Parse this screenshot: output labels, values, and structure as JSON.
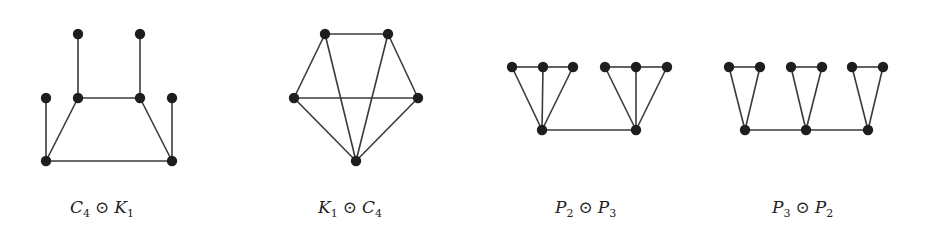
{
  "figure": {
    "graphs": [
      {
        "id": "c4-corona-k1",
        "label": {
          "left": "C",
          "left_sub": "4",
          "op": "⊙",
          "right": "K",
          "right_sub": "1"
        },
        "label_x": 70,
        "nodes": [
          [
            78,
            34
          ],
          [
            140,
            34
          ],
          [
            46,
            98
          ],
          [
            78,
            98
          ],
          [
            140,
            98
          ],
          [
            172,
            98
          ],
          [
            46,
            161
          ],
          [
            172,
            161
          ]
        ],
        "edges": [
          [
            0,
            3
          ],
          [
            1,
            4
          ],
          [
            2,
            6
          ],
          [
            5,
            7
          ],
          [
            3,
            4
          ],
          [
            3,
            6
          ],
          [
            4,
            7
          ],
          [
            6,
            7
          ]
        ]
      },
      {
        "id": "k1-corona-c4",
        "label": {
          "left": "K",
          "left_sub": "1",
          "op": "⊙",
          "right": "C",
          "right_sub": "4"
        },
        "label_x": 318,
        "nodes": [
          [
            325,
            34
          ],
          [
            388,
            34
          ],
          [
            294,
            98
          ],
          [
            418,
            98
          ],
          [
            356,
            161
          ]
        ],
        "edges": [
          [
            0,
            1
          ],
          [
            0,
            2
          ],
          [
            1,
            3
          ],
          [
            2,
            3
          ],
          [
            2,
            4
          ],
          [
            3,
            4
          ],
          [
            0,
            4
          ],
          [
            1,
            4
          ]
        ]
      },
      {
        "id": "p2-corona-p3",
        "label": {
          "left": "P",
          "left_sub": "2",
          "op": "⊙",
          "right": "P",
          "right_sub": "3"
        },
        "label_x": 555,
        "nodes": [
          [
            512,
            67
          ],
          [
            543,
            67
          ],
          [
            573,
            67
          ],
          [
            605,
            67
          ],
          [
            636,
            67
          ],
          [
            667,
            67
          ],
          [
            542,
            130
          ],
          [
            636,
            130
          ]
        ],
        "edges": [
          [
            0,
            1
          ],
          [
            1,
            2
          ],
          [
            3,
            4
          ],
          [
            4,
            5
          ],
          [
            0,
            6
          ],
          [
            1,
            6
          ],
          [
            2,
            6
          ],
          [
            3,
            7
          ],
          [
            4,
            7
          ],
          [
            5,
            7
          ],
          [
            6,
            7
          ]
        ]
      },
      {
        "id": "p3-corona-p2",
        "label": {
          "left": "P",
          "left_sub": "3",
          "op": "⊙",
          "right": "P",
          "right_sub": "2"
        },
        "label_x": 772,
        "nodes": [
          [
            729,
            67
          ],
          [
            760,
            67
          ],
          [
            791,
            67
          ],
          [
            822,
            67
          ],
          [
            852,
            67
          ],
          [
            883,
            67
          ],
          [
            745,
            130
          ],
          [
            806,
            130
          ],
          [
            868,
            130
          ]
        ],
        "edges": [
          [
            0,
            1
          ],
          [
            2,
            3
          ],
          [
            4,
            5
          ],
          [
            0,
            6
          ],
          [
            1,
            6
          ],
          [
            2,
            7
          ],
          [
            3,
            7
          ],
          [
            4,
            8
          ],
          [
            5,
            8
          ],
          [
            6,
            7
          ],
          [
            7,
            8
          ]
        ]
      }
    ],
    "node_radius": 5.2
  }
}
